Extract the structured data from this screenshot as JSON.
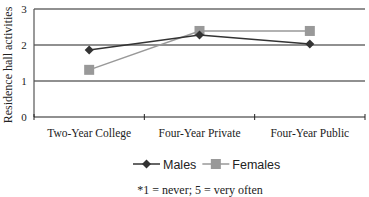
{
  "chart_data": {
    "type": "line",
    "title": "",
    "xlabel": "",
    "ylabel": "Residence hall activities",
    "ylim": [
      0,
      3
    ],
    "yticks": [
      0,
      1,
      2,
      3
    ],
    "grid": true,
    "categories": [
      "Two-Year College",
      "Four-Year Private",
      "Four-Year Public"
    ],
    "series": [
      {
        "name": "Males",
        "marker": "diamond",
        "color": "#333333",
        "values": [
          1.86,
          2.28,
          2.03
        ]
      },
      {
        "name": "Females",
        "marker": "square",
        "color": "#999999",
        "values": [
          1.31,
          2.39,
          2.39
        ]
      }
    ],
    "legend_position": "bottom",
    "footnote": "*1 = never; 5 = very often"
  }
}
